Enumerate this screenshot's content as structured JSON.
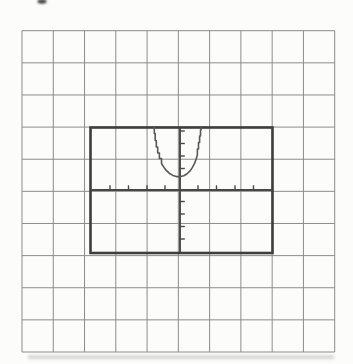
{
  "figure": {
    "canvas": {
      "width": 353,
      "height": 364,
      "background_color": "#fcfcfa"
    },
    "grid_paper": {
      "left": 22,
      "top": 30.7,
      "columns": 10,
      "rows": 10,
      "cell_width": 31.27,
      "cell_height": 32.13,
      "line_color": "#8c8c8c",
      "line_width": 1
    },
    "viewing_window": {
      "left": 90.5,
      "top": 127.5,
      "width": 182,
      "height": 125.5,
      "border_color": "#3e3e3e",
      "border_width": 2.6,
      "fill": "none"
    },
    "axes": {
      "stroke_color": "#474747",
      "stroke_width": 1.9,
      "tick_color": "#474747",
      "tick_width": 1.4,
      "x_axis": {
        "y": 190,
        "x1": 91,
        "x2": 272.5,
        "tick_xs": [
          110,
          128.5,
          147,
          165,
          198,
          216.5,
          235,
          253.5
        ],
        "tick_y1": 185.3,
        "tick_y2": 190.6
      },
      "y_axis": {
        "x": 180,
        "y1": 128,
        "y2": 252.5,
        "tick_ys": [
          131,
          143.5,
          156,
          168.5,
          201.5,
          214,
          226.5,
          239
        ],
        "tick_x1": 179.5,
        "tick_x2": 184.8
      }
    },
    "curve": {
      "shape": "upward-opening-parabola",
      "stroke_color": "#585858",
      "stroke_width": 1.6,
      "points": [
        [
          154.3,
          127.6
        ],
        [
          154.3,
          133.5
        ],
        [
          155.2,
          133.5
        ],
        [
          155.2,
          140.5
        ],
        [
          156.3,
          140.5
        ],
        [
          156.3,
          147
        ],
        [
          157.7,
          147
        ],
        [
          157.7,
          153
        ],
        [
          159.4,
          153
        ],
        [
          159.4,
          158.5
        ],
        [
          161.5,
          158.5
        ],
        [
          161.5,
          163.5
        ],
        [
          163.8,
          167.2
        ],
        [
          166.3,
          170.4
        ],
        [
          169.2,
          173.2
        ],
        [
          172.8,
          175.4
        ],
        [
          176.4,
          176.6
        ],
        [
          180.4,
          176.6
        ],
        [
          183.8,
          175.7
        ],
        [
          186.8,
          174
        ],
        [
          189.8,
          171.2
        ],
        [
          192.3,
          167.6
        ],
        [
          194.4,
          163.6
        ],
        [
          196.1,
          159.2
        ],
        [
          197.4,
          154.8
        ],
        [
          197.4,
          149
        ],
        [
          198.5,
          149
        ],
        [
          198.5,
          142.5
        ],
        [
          199.6,
          142.5
        ],
        [
          199.6,
          136
        ],
        [
          200.5,
          136
        ],
        [
          200.5,
          130
        ],
        [
          201.1,
          130
        ],
        [
          201.1,
          127.6
        ]
      ]
    },
    "artifacts": {
      "top_smudge": {
        "cx": 42,
        "cy": 1.5,
        "rx": 4.5,
        "ry": 2.2,
        "color": "#454545",
        "blur": 0.8
      },
      "bottom_shadow": {
        "x": 28,
        "y": 355.5,
        "width": 306,
        "height": 3.2,
        "color": "#cfcfca",
        "blur": 1.4
      }
    }
  }
}
